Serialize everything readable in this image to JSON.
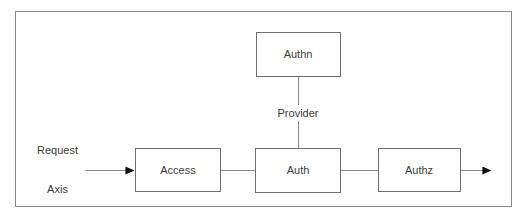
{
  "diagram": {
    "frame": {
      "x": 15,
      "y": 11,
      "width": 497,
      "height": 196,
      "stroke": "#8a8a8a",
      "fill": "#ffffff"
    },
    "style": {
      "node_stroke": "#6d6d6d",
      "node_fill": "#ffffff",
      "edge_stroke": "#8a8a8a",
      "arrow_fill": "#111111",
      "text_color": "#3b3b3b"
    },
    "nodes": [
      {
        "id": "authn",
        "label": "Authn",
        "x": 256,
        "y": 32,
        "width": 85,
        "height": 45,
        "cx": 298,
        "cy": 54
      },
      {
        "id": "access",
        "label": "Access",
        "x": 135,
        "y": 148,
        "width": 86,
        "height": 44,
        "cx": 178,
        "cy": 170
      },
      {
        "id": "auth",
        "label": "Auth",
        "x": 255,
        "y": 148,
        "width": 86,
        "height": 45,
        "cx": 298,
        "cy": 170
      },
      {
        "id": "authz",
        "label": "Authz",
        "x": 378,
        "y": 148,
        "width": 83,
        "height": 44,
        "cx": 419,
        "cy": 170
      }
    ],
    "edges": [
      {
        "id": "authn-to-auth",
        "from": "authn",
        "to": "auth",
        "label": "Provider",
        "label_x": 298,
        "label_y": 113,
        "orientation": "vertical",
        "arrowhead": false
      },
      {
        "id": "access-to-auth",
        "from": "access",
        "to": "auth",
        "label": "",
        "orientation": "horizontal",
        "arrowhead": false
      },
      {
        "id": "auth-to-authz",
        "from": "auth",
        "to": "authz",
        "label": "",
        "orientation": "horizontal",
        "arrowhead": false
      },
      {
        "id": "request-to-access",
        "from": "request-axis",
        "to": "access",
        "label": "",
        "orientation": "horizontal",
        "arrowhead": true
      },
      {
        "id": "authz-to-exit",
        "from": "authz",
        "to": "exit",
        "label": "",
        "orientation": "horizontal",
        "arrowhead": true
      }
    ],
    "input_label": {
      "id": "request-axis",
      "line1": "Request",
      "line2": "Axis",
      "x": 78,
      "y": 170
    }
  }
}
